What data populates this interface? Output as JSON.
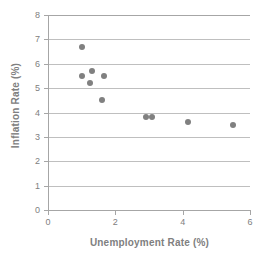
{
  "chart_data": {
    "type": "scatter",
    "title": "",
    "xlabel": "Unemployment Rate (%)",
    "ylabel": "Inflation Rate (%)",
    "xlim": [
      0,
      6
    ],
    "ylim": [
      0,
      8
    ],
    "xticks": [
      0,
      2,
      4,
      6
    ],
    "yticks": [
      0,
      1,
      2,
      3,
      4,
      5,
      6,
      7,
      8
    ],
    "grid": "horizontal",
    "legend": "none",
    "marker_color": "#808080",
    "axis_color": "#a6a6a6",
    "grid_color": "#bfbfbf",
    "label_color": "#808080",
    "series": [
      {
        "name": "Unemployment vs Inflation",
        "points": [
          {
            "x": 1.0,
            "y": 6.7
          },
          {
            "x": 1.0,
            "y": 5.5
          },
          {
            "x": 1.3,
            "y": 5.7
          },
          {
            "x": 1.25,
            "y": 5.2
          },
          {
            "x": 1.65,
            "y": 5.5
          },
          {
            "x": 1.6,
            "y": 4.5
          },
          {
            "x": 2.9,
            "y": 3.8
          },
          {
            "x": 3.1,
            "y": 3.8
          },
          {
            "x": 4.15,
            "y": 3.6
          },
          {
            "x": 5.5,
            "y": 3.5
          }
        ]
      }
    ]
  }
}
